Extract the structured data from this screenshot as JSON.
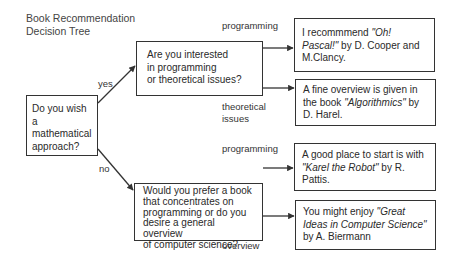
{
  "title": {
    "line1": "Book Recommendation",
    "line2": "Decision Tree"
  },
  "nodes": {
    "root": {
      "question": "Do you wish a mathematical approach?",
      "lines": [
        "Do you wish a",
        "mathematical",
        "approach?"
      ]
    },
    "math_yes": {
      "question": "Are you interested in programming or theoretical issues?",
      "lines": [
        "Are you interested",
        "in programming",
        "or theoretical issues?"
      ]
    },
    "math_no": {
      "question": "Would you prefer a book that concentrates on programming or do you desire a general overview of computer science?",
      "lines": [
        "Would you prefer a book",
        "that concentrates on",
        "programming or do you",
        "desire a general overview",
        "of computer science?"
      ]
    },
    "leaf_pascal": {
      "prefix": "I recommmend ",
      "book": "\"Oh! Pascal!\"",
      "suffix": " by D. Cooper and M.Clancy."
    },
    "leaf_algorithmics": {
      "prefix": "A fine overview is given in the book ",
      "book": "\"Algorithmics\"",
      "suffix": " by D. Harel."
    },
    "leaf_karel": {
      "prefix": "A good place to start is with ",
      "book": "\"Karel the Robot\"",
      "suffix": " by R. Pattis."
    },
    "leaf_great_ideas": {
      "prefix": "You might enjoy ",
      "book": "\"Great Ideas in Computer Science\"",
      "suffix": " by A. Biermann"
    }
  },
  "edges": {
    "yes": "yes",
    "no": "no",
    "programming_top": "programming",
    "theoretical_line1": "theoretical",
    "theoretical_line2": "issues",
    "programming_bottom": "programming",
    "overview": "overview"
  },
  "colors": {
    "stroke": "#333333",
    "text": "#2a2a2a",
    "background": "#ffffff"
  }
}
